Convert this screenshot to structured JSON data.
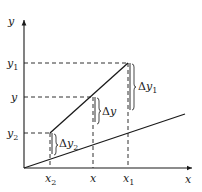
{
  "diagram": {
    "axes": {
      "x_label": "x",
      "y_label": "y"
    },
    "y_ticks": [
      {
        "name": "y",
        "sub": "1",
        "label_text": "y1"
      },
      {
        "name": "y",
        "sub": "",
        "label_text": "y"
      },
      {
        "name": "y",
        "sub": "2",
        "label_text": "y2"
      }
    ],
    "x_ticks": [
      {
        "name": "x",
        "sub": "2",
        "label_text": "x2"
      },
      {
        "name": "x",
        "sub": "",
        "label_text": "x"
      },
      {
        "name": "x",
        "sub": "1",
        "label_text": "x1"
      }
    ],
    "deltas": [
      {
        "delta": "Δ",
        "var": "y",
        "sub": "1",
        "label_text": "Δy1"
      },
      {
        "delta": "Δ",
        "var": "y",
        "sub": "",
        "label_text": "Δy"
      },
      {
        "delta": "Δ",
        "var": "y",
        "sub": "2",
        "label_text": "Δy2"
      }
    ],
    "lines": [
      {
        "name": "upper-line",
        "description": "line through (x2,y2), (x,y), (x1,y1)"
      },
      {
        "name": "lower-line",
        "description": "line through origin"
      }
    ],
    "colors": {
      "stroke": "#1a1a1a",
      "background": "#ffffff"
    }
  }
}
